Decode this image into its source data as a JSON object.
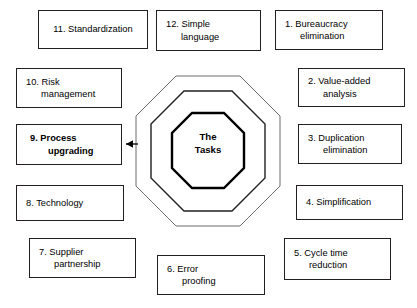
{
  "diagram": {
    "center": {
      "line1": "The",
      "line2": "Tasks"
    },
    "nodes": [
      {
        "id": "node-11",
        "line1": "11. Standardization",
        "line2": "",
        "emphasis": false
      },
      {
        "id": "node-12",
        "line1": "12. Simple",
        "line2": "language",
        "emphasis": false
      },
      {
        "id": "node-1",
        "line1": "1.  Bureaucracy",
        "line2": "elimination",
        "emphasis": false
      },
      {
        "id": "node-10",
        "line1": "10. Risk",
        "line2": "management",
        "emphasis": false
      },
      {
        "id": "node-2",
        "line1": "2.  Value-added",
        "line2": "analysis",
        "emphasis": false
      },
      {
        "id": "node-9",
        "line1": "9.  Process",
        "line2": "upgrading",
        "emphasis": true
      },
      {
        "id": "node-3",
        "line1": "3.  Duplication",
        "line2": "elimination",
        "emphasis": false
      },
      {
        "id": "node-8",
        "line1": "8.  Technology",
        "line2": "",
        "emphasis": false
      },
      {
        "id": "node-4",
        "line1": "4.  Simplification",
        "line2": "",
        "emphasis": false
      },
      {
        "id": "node-7",
        "line1": "7.  Supplier",
        "line2": "partnership",
        "emphasis": false
      },
      {
        "id": "node-6",
        "line1": "6.  Error",
        "line2": "proofing",
        "emphasis": false
      },
      {
        "id": "node-5",
        "line1": "5.  Cycle time",
        "line2": "reduction",
        "emphasis": false
      }
    ],
    "connector": {
      "name": "arrow-to-process-upgrading",
      "direction": "left"
    },
    "colors": {
      "stroke": "#231f20",
      "text": "#000000",
      "background": "#ffffff"
    }
  }
}
